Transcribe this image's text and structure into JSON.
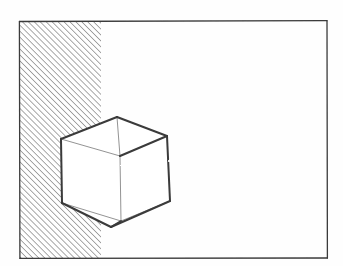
{
  "figure": {
    "kind": "hand-drawn-line-drawing",
    "title": "Wireframe cube overlapping a hatched region",
    "background_color": "#fefefe",
    "ink_color": "#3a3a3a",
    "hatch_color": "#6b6b6b",
    "faint_ink_color": "#8d8d8d",
    "frame": {
      "name": "outer-frame",
      "x": 19,
      "y": 21,
      "width": 308,
      "height": 237,
      "stroke_width": 1.3
    },
    "hatched_region": {
      "name": "hatched-band",
      "x": 20,
      "y": 22,
      "width": 81,
      "height": 236,
      "hatch_angle_deg": 45,
      "hatch_spacing": 4.2,
      "hatch_stroke_width": 1.15,
      "fill": "#ffffff"
    },
    "cube": {
      "name": "wireframe-cube",
      "style": "necker-cube",
      "stroke_width_visible": 2.0,
      "stroke_width_hidden": 0.95,
      "vertices": {
        "front_top_left": [
          61,
          139
        ],
        "front_top_right": [
          120,
          156
        ],
        "front_bottom_right": [
          121,
          221
        ],
        "front_bottom_left": [
          62,
          203
        ],
        "back_top_left": [
          117,
          117
        ],
        "back_top_right": [
          167,
          136
        ],
        "back_bottom_right": [
          170,
          201
        ],
        "back_bottom_left": [
          111,
          227
        ]
      },
      "edges_visible": [
        [
          "back_top_left",
          "front_top_left"
        ],
        [
          "back_top_left",
          "back_top_right"
        ],
        [
          "back_top_right",
          "back_bottom_right"
        ],
        [
          "back_bottom_right",
          "back_bottom_left"
        ],
        [
          "back_bottom_left",
          "front_bottom_left"
        ],
        [
          "front_bottom_left",
          "front_top_left"
        ],
        [
          "front_top_right",
          "back_top_right"
        ],
        [
          "front_bottom_right",
          "back_bottom_left"
        ]
      ],
      "edges_faint": [
        [
          "front_top_left",
          "front_top_right"
        ],
        [
          "front_top_right",
          "front_bottom_right"
        ],
        [
          "front_bottom_right",
          "front_bottom_left"
        ],
        [
          "back_top_left",
          "front_top_right"
        ],
        [
          "front_bottom_right",
          "back_bottom_right"
        ]
      ]
    }
  }
}
